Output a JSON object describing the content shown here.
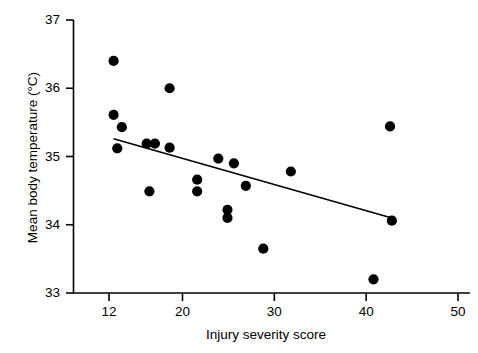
{
  "figure": {
    "title": "",
    "xlabel": "Injury severity score",
    "ylabel": "Mean body temperature (°C)",
    "marker_color": "#000000",
    "line_color": "#000000",
    "axis_color": "#000000",
    "background": "#ffffff"
  },
  "axes": {
    "x_ticks": [
      "12",
      "20",
      "30",
      "40",
      "50"
    ],
    "y_ticks": [
      "33",
      "34",
      "35",
      "36",
      "37"
    ]
  },
  "chart_data": {
    "type": "scatter",
    "title": "",
    "xlabel": "Injury severity score",
    "ylabel": "Mean body temperature (°C)",
    "xlim": [
      8.5,
      50
    ],
    "ylim": [
      33,
      37
    ],
    "xticks": [
      12,
      20,
      30,
      40,
      50
    ],
    "yticks": [
      33,
      34,
      35,
      36,
      37
    ],
    "grid": false,
    "legend": null,
    "series": [
      {
        "name": "Patients",
        "marker": "filled-circle",
        "color": "#000000",
        "points": [
          {
            "x": 12.5,
            "y": 36.4
          },
          {
            "x": 12.5,
            "y": 35.61
          },
          {
            "x": 13.4,
            "y": 35.43
          },
          {
            "x": 12.9,
            "y": 35.12
          },
          {
            "x": 16.1,
            "y": 35.19
          },
          {
            "x": 17.0,
            "y": 35.19
          },
          {
            "x": 18.6,
            "y": 36.0
          },
          {
            "x": 18.6,
            "y": 35.13
          },
          {
            "x": 16.4,
            "y": 34.49
          },
          {
            "x": 21.6,
            "y": 34.66
          },
          {
            "x": 21.6,
            "y": 34.49
          },
          {
            "x": 23.9,
            "y": 34.97
          },
          {
            "x": 25.6,
            "y": 34.9
          },
          {
            "x": 24.9,
            "y": 34.22
          },
          {
            "x": 24.9,
            "y": 34.1
          },
          {
            "x": 26.9,
            "y": 34.57
          },
          {
            "x": 28.8,
            "y": 33.65
          },
          {
            "x": 31.8,
            "y": 34.78
          },
          {
            "x": 40.8,
            "y": 33.2
          },
          {
            "x": 42.6,
            "y": 35.44
          },
          {
            "x": 42.8,
            "y": 34.06
          }
        ]
      }
    ],
    "trend_line": {
      "name": "Regression line",
      "color": "#000000",
      "x_start": 12.5,
      "y_start": 35.26,
      "x_end": 42.8,
      "y_end": 34.1
    }
  }
}
